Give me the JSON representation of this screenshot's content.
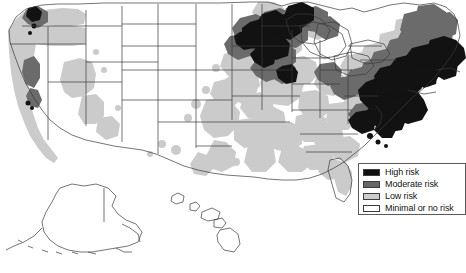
{
  "figure": {
    "type": "choropleth-map",
    "width": 466,
    "height": 273,
    "background_color": "#ffffff"
  },
  "legend": {
    "name": "risk-legend",
    "position": "bottom-right",
    "border_color": "#5a5a5a",
    "background_color": "#ffffff",
    "items": [
      {
        "label": "High risk",
        "color": "#111111",
        "swatch": "high-risk-swatch"
      },
      {
        "label": "Moderate risk",
        "color": "#666666",
        "swatch": "moderate-risk-swatch"
      },
      {
        "label": "Low risk",
        "color": "#cccccc",
        "swatch": "low-risk-swatch"
      },
      {
        "label": "Minimal or no risk",
        "color": "#ffffff",
        "swatch": "minimal-risk-swatch"
      }
    ]
  },
  "map": {
    "outline_color": "#3a3a3a",
    "insets": [
      {
        "name": "alaska-inset",
        "risk": "Minimal or no risk"
      },
      {
        "name": "hawaii-inset",
        "risk": "Minimal or no risk"
      }
    ],
    "regions": [
      {
        "name": "northeast-corridor",
        "states": "NY, CT, RI, MA, NJ, eastern PA",
        "risk": "High risk"
      },
      {
        "name": "upper-midwest",
        "states": "WI, MN, northern MI",
        "risk": "High risk"
      },
      {
        "name": "northern-new-england",
        "states": "ME, NH, VT",
        "risk": "Moderate risk"
      },
      {
        "name": "mid-atlantic",
        "states": "MD, DE, VA, WV",
        "risk": "Moderate risk"
      },
      {
        "name": "great-lakes",
        "states": "OH, IN, IL, lower MI",
        "risk": "Low risk"
      },
      {
        "name": "southeast",
        "states": "GA, AL, MS, SC, NC, TN, KY",
        "risk": "Low risk"
      },
      {
        "name": "pacific-coast",
        "states": "CA, OR, WA coastal",
        "risk": "Low risk"
      },
      {
        "name": "northern-california",
        "states": "coastal northern CA",
        "risk": "Moderate risk"
      },
      {
        "name": "great-plains",
        "states": "MT, WY, ND, SD, NE, KS, CO, NM, TX interior",
        "risk": "Minimal or no risk"
      },
      {
        "name": "intermountain-west",
        "states": "ID, NV, UT, AZ",
        "risk": "Minimal or no risk"
      }
    ]
  }
}
